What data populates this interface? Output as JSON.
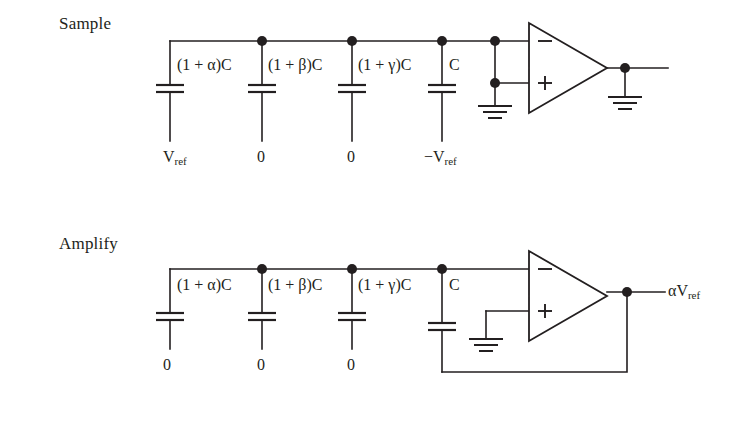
{
  "figure": {
    "background": "#ffffff",
    "ink_color": "#231f20",
    "width": 747,
    "height": 424
  },
  "stages": [
    {
      "id": "sample",
      "title": "Sample",
      "capacitors": [
        {
          "label_html": "(1 + α)C",
          "source_label_html": "V<sub>ref</sub>"
        },
        {
          "label_html": "(1 + β)C",
          "source_label_html": "0"
        },
        {
          "label_html": "(1 + γ)C",
          "source_label_html": "0"
        },
        {
          "label_html": "C",
          "source_label_html": "−V<sub>ref</sub>"
        }
      ],
      "opamp": {
        "minus_input": "−",
        "plus_input": "+",
        "inputs_shorted_to_ground": true
      },
      "output_label_html": "",
      "output_grounded": true
    },
    {
      "id": "amplify",
      "title": "Amplify",
      "capacitors": [
        {
          "label_html": "(1 + α)C",
          "source_label_html": "0"
        },
        {
          "label_html": "(1 + β)C",
          "source_label_html": "0"
        },
        {
          "label_html": "(1 + γ)C",
          "source_label_html": "0"
        },
        {
          "label_html": "C",
          "source_label_html": ""
        }
      ],
      "opamp": {
        "minus_input": "−",
        "plus_input": "+",
        "plus_grounded": true
      },
      "output_label_html": "αV<sub>ref</sub>",
      "feedback_from_output_to_C": true
    }
  ],
  "labels": {
    "cap_1": "(1 + α)C",
    "cap_2": "(1 + β)C",
    "cap_3": "(1 + γ)C",
    "cap_4": "C",
    "zero": "0",
    "vref": "V",
    "vref_sub": "ref",
    "neg_vref_prefix": "−V",
    "alpha_vref_prefix": "αV",
    "minus_sign": "−",
    "plus_sign": "+"
  }
}
